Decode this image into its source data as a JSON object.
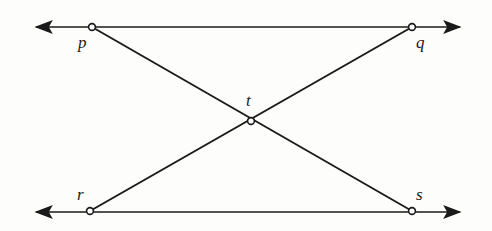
{
  "figure": {
    "type": "geometry-diagram",
    "background_color": "#fdfdfc",
    "stroke_color": "#1a1a1a",
    "node_fill_color": "#ffffff",
    "stroke_width": 1.7,
    "node_radius": 3.4
  },
  "points": [
    {
      "id": "p",
      "label": "p",
      "x": 92,
      "y": 27,
      "label_x": 78,
      "label_y": 34
    },
    {
      "id": "q",
      "label": "q",
      "x": 412,
      "y": 27,
      "label_x": 416,
      "label_y": 34
    },
    {
      "id": "t",
      "label": "t",
      "x": 251,
      "y": 121,
      "label_x": 246,
      "label_y": 92
    },
    {
      "id": "r",
      "label": "r",
      "x": 90,
      "y": 211,
      "label_x": 77,
      "label_y": 186
    },
    {
      "id": "s",
      "label": "s",
      "x": 412,
      "y": 211,
      "label_x": 416,
      "label_y": 186
    }
  ],
  "lines": [
    {
      "id": "top-line",
      "from": "p",
      "to": "q",
      "x1": 36,
      "y1": 27,
      "x2": 460,
      "y2": 27,
      "arrow_start": true,
      "arrow_end": true
    },
    {
      "id": "bottom-line",
      "from": "r",
      "to": "s",
      "x1": 36,
      "y1": 212,
      "x2": 460,
      "y2": 212,
      "arrow_start": true,
      "arrow_end": true
    },
    {
      "id": "transversal-ps",
      "from": "p",
      "to": "s",
      "x1": 92,
      "y1": 27,
      "x2": 412,
      "y2": 211,
      "arrow_start": false,
      "arrow_end": false
    },
    {
      "id": "transversal-rq",
      "from": "r",
      "to": "q",
      "x1": 90,
      "y1": 211,
      "x2": 412,
      "y2": 27,
      "arrow_start": false,
      "arrow_end": false
    }
  ]
}
